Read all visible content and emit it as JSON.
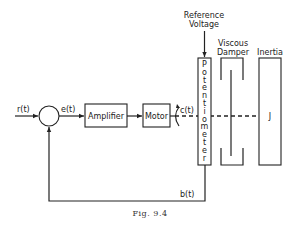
{
  "figure": {
    "caption": "Fig. 9.4",
    "signals": {
      "input": "r(t)",
      "error": "e(t)",
      "output": "c(t)",
      "feedback": "b(t)"
    },
    "blocks": {
      "amplifier": "Amplifier",
      "motor": "Motor",
      "potentiometer_letters": [
        "P",
        "o",
        "t",
        "e",
        "n",
        "t",
        "i",
        "o",
        "m",
        "e",
        "t",
        "e",
        "r"
      ],
      "inertia_symbol": "J"
    },
    "labels": {
      "reference_voltage_line1": "Reference",
      "reference_voltage_line2": "Voltage",
      "viscous_damper_line1": "Viscous",
      "viscous_damper_line2": "Damper",
      "inertia": "Inertia"
    }
  }
}
